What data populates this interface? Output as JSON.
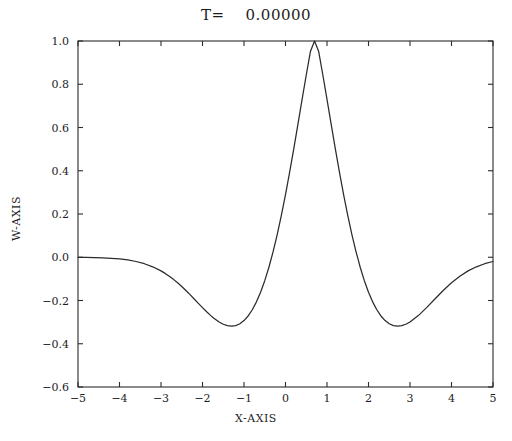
{
  "chart_data": {
    "type": "line",
    "title": "T=    0.00000",
    "xlabel": "X-AXIS",
    "ylabel": "W-AXIS",
    "xlim": [
      -5,
      5
    ],
    "ylim": [
      -0.6,
      1.0
    ],
    "grid": false,
    "legend": null,
    "xticks": [
      -5,
      -4,
      -3,
      -2,
      -1,
      0,
      1,
      2,
      3,
      4,
      5
    ],
    "xticklabels": [
      "-5",
      "-4",
      "-3",
      "-2",
      "-1",
      "0",
      "1",
      "2",
      "3",
      "4",
      "5"
    ],
    "yticks": [
      -0.6,
      -0.4,
      -0.2,
      0.0,
      0.2,
      0.4,
      0.6,
      0.8,
      1.0
    ],
    "yticklabels": [
      "-0.6",
      "-0.4",
      "-0.2",
      "0.0",
      "0.2",
      "0.4",
      "0.6",
      "0.8",
      "1.0"
    ],
    "line_color": "#2b2b2b",
    "series": [
      {
        "name": "W",
        "x": [
          -5.0,
          -4.8,
          -4.6,
          -4.4,
          -4.2,
          -4.0,
          -3.8,
          -3.6,
          -3.4,
          -3.2,
          -3.0,
          -2.9,
          -2.8,
          -2.7,
          -2.6,
          -2.5,
          -2.4,
          -2.3,
          -2.2,
          -2.1,
          -2.0,
          -1.9,
          -1.8,
          -1.75,
          -1.7,
          -1.6,
          -1.5,
          -1.4,
          -1.3,
          -1.2,
          -1.1,
          -1.0,
          -0.9,
          -0.8,
          -0.7,
          -0.6,
          -0.5,
          -0.4,
          -0.3,
          -0.2,
          -0.1,
          0.0,
          0.1,
          0.2,
          0.3,
          0.4,
          0.5,
          0.6,
          0.7,
          0.8,
          0.9,
          1.0,
          1.1,
          1.2,
          1.3,
          1.4,
          1.5,
          1.6,
          1.7,
          1.75,
          1.8,
          1.9,
          2.0,
          2.1,
          2.2,
          2.3,
          2.4,
          2.5,
          2.6,
          2.7,
          2.8,
          2.9,
          3.0,
          3.2,
          3.4,
          3.6,
          3.8,
          4.0,
          4.2,
          4.4,
          4.6,
          4.8,
          5.0
        ],
        "y": [
          -0.0005,
          -0.0009,
          -0.0016,
          -0.0028,
          -0.0047,
          -0.0078,
          -0.0126,
          -0.0197,
          -0.0299,
          -0.0441,
          -0.063,
          -0.0747,
          -0.0878,
          -0.1023,
          -0.1182,
          -0.1354,
          -0.1538,
          -0.1731,
          -0.193,
          -0.2131,
          -0.233,
          -0.2521,
          -0.2699,
          -0.2782,
          -0.2859,
          -0.2994,
          -0.3098,
          -0.3164,
          -0.3187,
          -0.3159,
          -0.3075,
          -0.2929,
          -0.2715,
          -0.2428,
          -0.2063,
          -0.1616,
          -0.1083,
          -0.0462,
          0.0249,
          0.1049,
          0.1935,
          0.29,
          0.3935,
          0.5026,
          0.6155,
          0.7298,
          0.8428,
          0.9512,
          1.0,
          0.9512,
          0.8428,
          0.7298,
          0.6155,
          0.5026,
          0.3935,
          0.29,
          0.1935,
          0.1049,
          0.0249,
          -0.01,
          -0.0462,
          -0.1083,
          -0.1616,
          -0.2063,
          -0.2428,
          -0.2715,
          -0.2929,
          -0.3075,
          -0.3159,
          -0.3187,
          -0.3164,
          -0.3098,
          -0.2994,
          -0.2699,
          -0.233,
          -0.193,
          -0.1538,
          -0.1182,
          -0.0878,
          -0.063,
          -0.0441,
          -0.0299,
          -0.0197
        ]
      }
    ],
    "annotations": {
      "peak_value": 1.0,
      "peak_x": 0.0,
      "minimum_value": -0.45,
      "minimum_x_left": -1.75,
      "minimum_x_right": 1.75,
      "zero_crossing_left": -1.0,
      "zero_crossing_right": 1.0
    }
  }
}
